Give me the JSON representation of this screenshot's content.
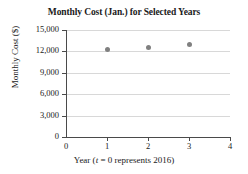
{
  "chart_data": {
    "type": "scatter",
    "title": "Monthly Cost (Jan.) for Selected Years",
    "xlabel_parts": {
      "prefix": "Year (",
      "variable": "t",
      "suffix": " = 0 represents 2016)"
    },
    "xlabel": "Year (t = 0 represents 2016)",
    "ylabel": "Monthly Cost ($)",
    "x": [
      1,
      2,
      3
    ],
    "values": [
      12300,
      12600,
      13000
    ],
    "points": [
      {
        "x": 1,
        "y": 12300
      },
      {
        "x": 2,
        "y": 12600
      },
      {
        "x": 3,
        "y": 13000
      }
    ],
    "xlim": [
      0,
      4
    ],
    "ylim": [
      0,
      15000
    ],
    "xticks": [
      0,
      1,
      2,
      3,
      4
    ],
    "xtick_labels": [
      "0",
      "1",
      "2",
      "3",
      "4"
    ],
    "yticks": [
      0,
      3000,
      6000,
      9000,
      12000,
      15000
    ],
    "ytick_labels": [
      "0",
      "3,000",
      "6,000",
      "9,000",
      "12,000",
      "15,000"
    ],
    "grid": true,
    "grid_axis": "y",
    "legend": false,
    "marker_color": "#808080",
    "axis_color": "#4a4a4a",
    "grid_color": "#d8d8d8",
    "background": "#ffffff"
  }
}
